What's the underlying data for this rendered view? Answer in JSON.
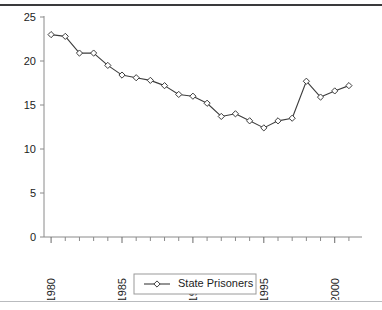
{
  "chart_data": {
    "type": "line",
    "title": "",
    "xlabel": "",
    "ylabel": "",
    "xlim": [
      1979.5,
      2001.5
    ],
    "ylim": [
      0,
      25
    ],
    "grid": false,
    "legend_position": "bottom-center",
    "x_tick_labels": [
      "1980",
      "1985",
      "1990",
      "1995",
      "2000"
    ],
    "x_tick_values": [
      1980,
      1985,
      1990,
      1995,
      2000
    ],
    "x_minor_ticks": [
      1981,
      1982,
      1983,
      1984,
      1986,
      1987,
      1988,
      1989,
      1991,
      1992,
      1993,
      1994,
      1996,
      1997,
      1998,
      1999,
      2001
    ],
    "y_tick_labels": [
      "0",
      "5",
      "10",
      "15",
      "20",
      "25"
    ],
    "y_tick_values": [
      0,
      5,
      10,
      15,
      20,
      25
    ],
    "x": [
      1980,
      1981,
      1982,
      1983,
      1984,
      1985,
      1986,
      1987,
      1988,
      1989,
      1990,
      1991,
      1992,
      1993,
      1994,
      1995,
      1996,
      1997,
      1998,
      1999,
      2000,
      2001
    ],
    "series": [
      {
        "name": "State Prisoners",
        "marker": "diamond",
        "color": "#3d3d3d",
        "values": [
          23.0,
          22.8,
          20.9,
          20.9,
          19.5,
          18.4,
          18.1,
          17.8,
          17.2,
          16.2,
          16.0,
          15.2,
          13.7,
          14.0,
          13.2,
          12.4,
          13.2,
          13.5,
          17.7,
          15.9,
          16.6,
          17.2
        ]
      }
    ]
  },
  "legend": {
    "entries": [
      {
        "label": "State Prisoners"
      }
    ]
  },
  "axis": {
    "y_label_text": "",
    "x_label_text": ""
  }
}
